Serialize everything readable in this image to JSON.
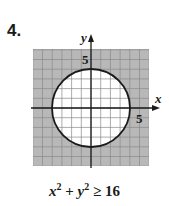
{
  "problem": {
    "number": "4."
  },
  "chart_data": {
    "type": "region",
    "title": "",
    "inequality": "x^2 + y^2 ≥ 16",
    "xlabel": "x",
    "ylabel": "y",
    "xlim": [
      -6,
      6
    ],
    "ylim": [
      -6,
      6
    ],
    "grid": true,
    "tick_labels": [
      {
        "axis": "x",
        "value": 5,
        "label": "5"
      },
      {
        "axis": "y",
        "value": 5,
        "label": "5"
      }
    ],
    "boundary": {
      "shape": "circle",
      "center": [
        0,
        0
      ],
      "radius": 4,
      "style": "solid"
    },
    "shaded_region": "outside circle",
    "colors": {
      "shade": "#b8b8b8",
      "grid": "#7a7a7a",
      "line": "#1a1a1a"
    }
  },
  "labels": {
    "x_axis": "x",
    "y_axis": "y",
    "x_tick": "5",
    "y_tick": "5"
  },
  "caption": {
    "x": "x",
    "sup1": "2",
    "plus": " + ",
    "y": "y",
    "sup2": "2",
    "rel": " ≥ 16"
  }
}
